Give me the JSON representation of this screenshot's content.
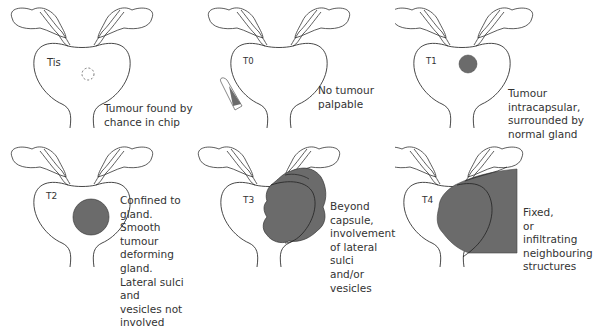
{
  "diagram": {
    "type": "prostate tumour T-staging",
    "colors": {
      "outline": "#333333",
      "tumour_fill": "#6b6b6b",
      "background": "#ffffff"
    },
    "panels": [
      {
        "stage": "Tis",
        "description": "Tumour found by\nchance in chip",
        "tumour": "dashed-circle"
      },
      {
        "stage": "T0",
        "description": "No tumour\npalpable",
        "tumour": "none",
        "extra": "finger-icon"
      },
      {
        "stage": "T1",
        "description": "Tumour\nintracapsular,\nsurrounded by\nnormal gland",
        "tumour": "small-solid-circle"
      },
      {
        "stage": "T2",
        "description": "Confined to gland.\nSmooth tumour\ndeforming gland.\nLateral sulci and\nvesicles not\ninvolved",
        "tumour": "large-solid-circle"
      },
      {
        "stage": "T3",
        "description": "Beyond capsule,\ninvolvement\nof lateral sulci\nand/or vesicles",
        "tumour": "extracapsular-mass"
      },
      {
        "stage": "T4",
        "description": "Fixed,\nor\ninfiltrating\nneighbouring\nstructures",
        "tumour": "fixed-mass"
      }
    ]
  }
}
